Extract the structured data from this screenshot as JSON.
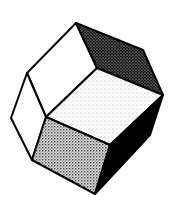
{
  "figure": {
    "background": "#ffffff",
    "stroke": "#000000",
    "faces": [
      {
        "name": "upper-left-face",
        "shade": "white"
      },
      {
        "name": "left-face",
        "shade": "white"
      },
      {
        "name": "upper-right-face",
        "shade": "dark-stipple"
      },
      {
        "name": "top-face",
        "shade": "light-stipple"
      },
      {
        "name": "front-face",
        "shade": "medium-stipple"
      },
      {
        "name": "right-face",
        "shade": "black"
      }
    ]
  }
}
